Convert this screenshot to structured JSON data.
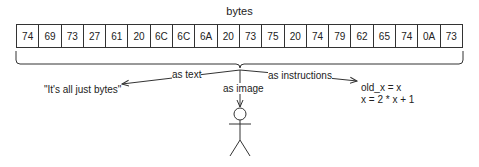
{
  "title": "bytes",
  "bytes": [
    "74",
    "69",
    "73",
    "27",
    "61",
    "20",
    "6C",
    "6C",
    "6A",
    "20",
    "73",
    "75",
    "20",
    "74",
    "79",
    "62",
    "65",
    "74",
    "0A",
    "73"
  ],
  "interpretations": {
    "text": {
      "label": "as text",
      "result": "\"It's all just bytes\""
    },
    "image": {
      "label": "as image",
      "result": "stick-figure"
    },
    "instructions": {
      "label": "as instructions",
      "result_lines": [
        "old_x = x",
        "x = 2 * x + 1"
      ]
    }
  }
}
